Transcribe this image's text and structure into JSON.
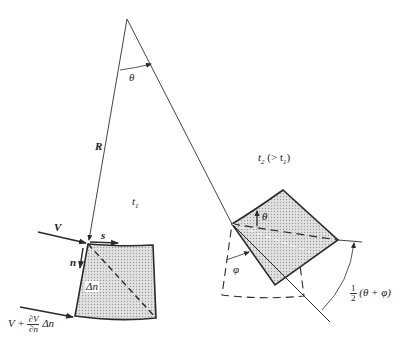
{
  "figure": {
    "colors": {
      "line": "#2a2a2a",
      "fill": "#d6d6d6",
      "background": "#ffffff"
    }
  },
  "labels": {
    "theta_top": "θ",
    "R": "R",
    "t1": "t",
    "t1_sub": "1",
    "t2": "t",
    "t2_sub": "2",
    "t2_cond": "(> t",
    "t2_cond_sub": "1",
    "t2_cond_close": ")",
    "V": "V",
    "s": "s",
    "n": "n",
    "delta_n": "Δn",
    "V_plus": "V +",
    "dV": "∂V",
    "dn": "∂n",
    "delta_n2": "Δn",
    "theta_small": "θ",
    "phi": "φ",
    "half_num": "1",
    "half_den": "2",
    "half_expr": "(θ + φ)"
  }
}
